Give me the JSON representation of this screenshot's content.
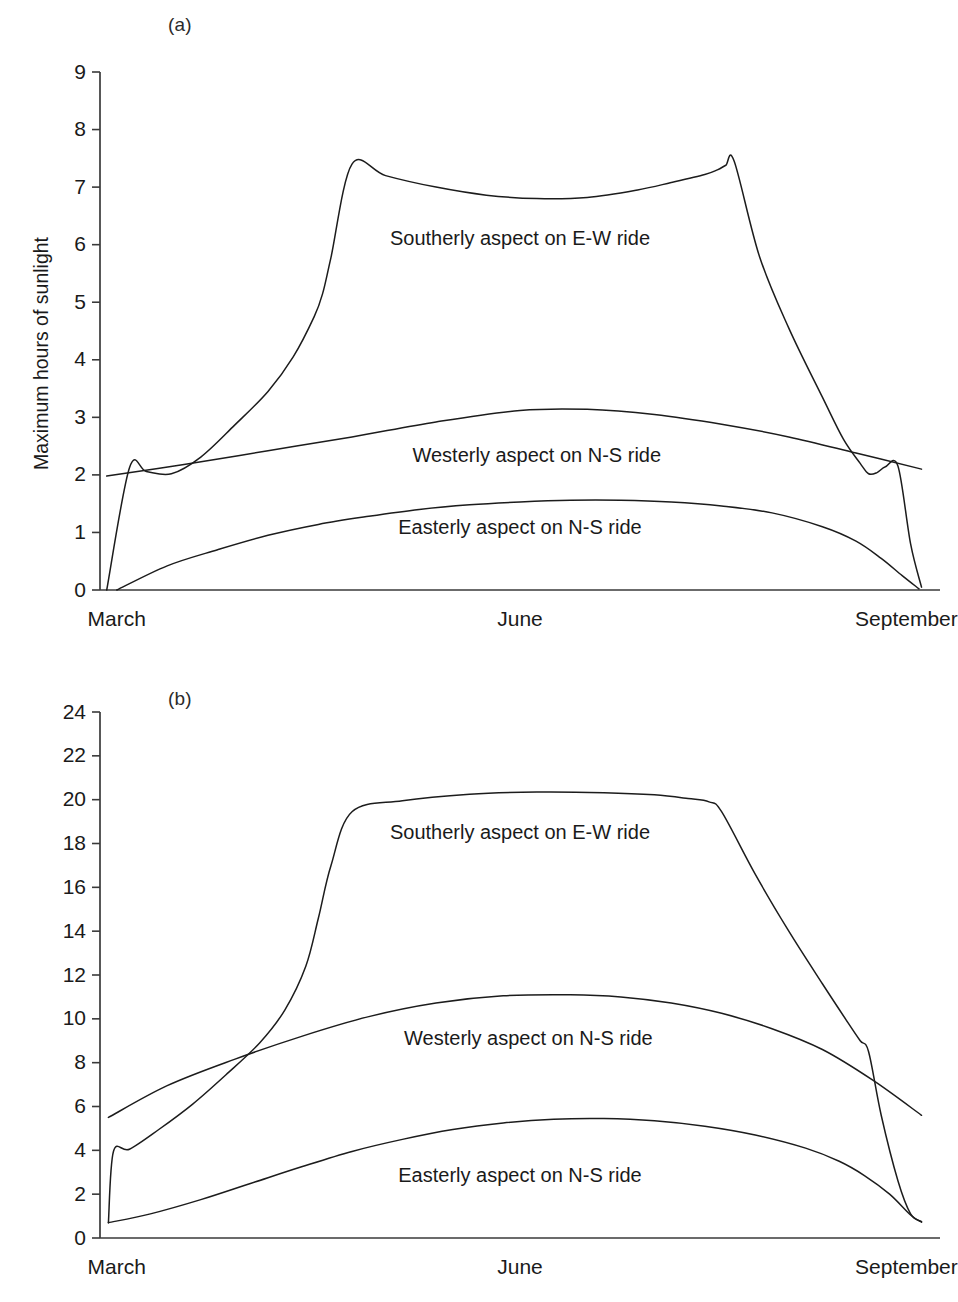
{
  "figure": {
    "panels": [
      {
        "key": "a",
        "label": "(a)",
        "ylabel_main": "Maximum hours of sunlight",
        "ylabel_sup": ""
      },
      {
        "key": "b",
        "label": "(b)",
        "ylabel_main": "Heat energy (MJ m",
        "ylabel_sup": "-2",
        "ylabel_tail": ")"
      }
    ]
  },
  "chart_data": [
    {
      "type": "line",
      "panel": "(a)",
      "title": "",
      "xlabel": "",
      "ylabel": "Maximum hours of sunlight",
      "xlim": [
        0,
        100
      ],
      "ylim": [
        0,
        9
      ],
      "xticks": [
        2,
        50,
        96
      ],
      "xtick_labels": [
        "March",
        "June",
        "September"
      ],
      "yticks": [
        0,
        1,
        2,
        3,
        4,
        5,
        6,
        7,
        8,
        9
      ],
      "ytick_labels": [
        "0",
        "1",
        "2",
        "3",
        "4",
        "5",
        "6",
        "7",
        "8",
        "9"
      ],
      "grid": false,
      "legend_position": "inline-annotations",
      "series": [
        {
          "name": "Southerly aspect on E-W ride",
          "label_x": 50,
          "label_y": 6.0,
          "x": [
            0.8,
            3.5,
            5.5,
            8.5,
            12.0,
            16.0,
            20.0,
            23.0,
            25.5,
            26.5,
            27.5,
            30.0,
            34.0,
            40.0,
            46.0,
            52.0,
            58.0,
            64.0,
            68.0,
            72.0,
            73.5,
            74.5,
            75.5,
            78.5,
            82.0,
            86.0,
            88.5,
            90.5,
            91.5,
            92.5,
            93.5,
            95.0,
            96.5,
            97.8
          ],
          "y": [
            0.0,
            2.12,
            2.06,
            2.02,
            2.31,
            2.86,
            3.45,
            4.05,
            4.75,
            5.15,
            5.78,
            7.4,
            7.2,
            7.0,
            6.86,
            6.8,
            6.82,
            6.95,
            7.08,
            7.22,
            7.3,
            7.38,
            7.45,
            5.8,
            4.55,
            3.35,
            2.62,
            2.2,
            2.02,
            2.04,
            2.14,
            2.15,
            0.8,
            0.05
          ]
        },
        {
          "name": "Westerly aspect on N-S ride",
          "label_x": 52,
          "label_y": 2.22,
          "x": [
            0.8,
            10,
            20,
            30,
            40,
            50,
            58,
            66,
            74,
            82,
            90,
            97.8
          ],
          "y": [
            1.98,
            2.18,
            2.42,
            2.66,
            2.92,
            3.12,
            3.14,
            3.05,
            2.88,
            2.66,
            2.38,
            2.1
          ]
        },
        {
          "name": "Easterly aspect on N-S ride",
          "label_x": 50,
          "label_y": 0.98,
          "x": [
            2.0,
            8,
            14,
            20,
            26,
            32,
            38,
            44,
            50,
            56,
            62,
            68,
            74,
            80,
            86,
            90,
            93,
            95.5,
            97.5
          ],
          "y": [
            0.0,
            0.42,
            0.7,
            0.95,
            1.14,
            1.28,
            1.4,
            1.48,
            1.53,
            1.56,
            1.56,
            1.53,
            1.46,
            1.34,
            1.1,
            0.85,
            0.55,
            0.25,
            0.02
          ]
        }
      ]
    },
    {
      "type": "line",
      "panel": "(b)",
      "title": "",
      "xlabel": "",
      "ylabel": "Heat energy (MJ m-2)",
      "xlim": [
        0,
        100
      ],
      "ylim": [
        0,
        24
      ],
      "xticks": [
        2,
        50,
        96
      ],
      "xtick_labels": [
        "March",
        "June",
        "September"
      ],
      "yticks": [
        0,
        2,
        4,
        6,
        8,
        10,
        12,
        14,
        16,
        18,
        20,
        22,
        24
      ],
      "ytick_labels": [
        "0",
        "2",
        "4",
        "6",
        "8",
        "10",
        "12",
        "14",
        "16",
        "18",
        "20",
        "22",
        "24"
      ],
      "grid": false,
      "legend_position": "inline-annotations",
      "series": [
        {
          "name": "Southerly aspect on E-W ride",
          "label_x": 50,
          "label_y": 18.2,
          "x": [
            1.0,
            1.6,
            3.5,
            7.0,
            11.0,
            15.0,
            19.0,
            22.0,
            24.5,
            26.0,
            27.5,
            30.0,
            36.0,
            44.0,
            52.0,
            60.0,
            66.0,
            70.0,
            72.5,
            74.0,
            78.0,
            82.0,
            86.0,
            89.0,
            90.5,
            91.5,
            93.0,
            95.0,
            96.5,
            97.8
          ],
          "y": [
            0.7,
            3.95,
            4.05,
            4.95,
            6.1,
            7.45,
            8.9,
            10.4,
            12.4,
            14.6,
            17.0,
            19.45,
            19.95,
            20.25,
            20.35,
            20.32,
            20.22,
            20.05,
            19.9,
            19.45,
            16.6,
            14.0,
            11.6,
            9.85,
            9.0,
            8.5,
            5.6,
            2.6,
            1.1,
            0.75
          ]
        },
        {
          "name": "Westerly aspect on N-S ride",
          "label_x": 51,
          "label_y": 8.8,
          "x": [
            1.0,
            8,
            16,
            24,
            32,
            40,
            48,
            56,
            62,
            68,
            74,
            80,
            86,
            92,
            97.8
          ],
          "y": [
            5.5,
            6.95,
            8.15,
            9.2,
            10.1,
            10.72,
            11.05,
            11.1,
            11.0,
            10.72,
            10.25,
            9.55,
            8.6,
            7.2,
            5.6
          ]
        },
        {
          "name": "Easterly aspect on N-S ride",
          "label_x": 50,
          "label_y": 2.55,
          "x": [
            1.0,
            6,
            12,
            18,
            24,
            30,
            36,
            42,
            48,
            54,
            60,
            66,
            72,
            78,
            84,
            88,
            91,
            94,
            96.5,
            97.8
          ],
          "y": [
            0.7,
            1.1,
            1.75,
            2.5,
            3.25,
            3.95,
            4.5,
            4.95,
            5.25,
            5.42,
            5.45,
            5.35,
            5.1,
            4.7,
            4.1,
            3.5,
            2.85,
            2.0,
            1.05,
            0.72
          ]
        }
      ]
    }
  ]
}
